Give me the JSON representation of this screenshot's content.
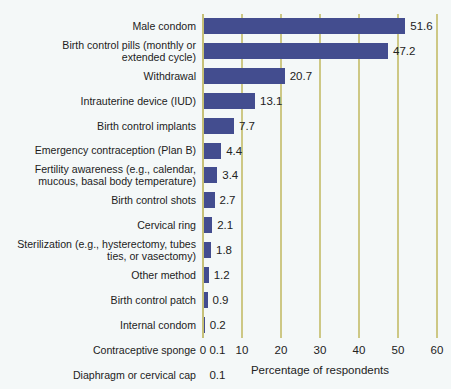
{
  "chart_data": {
    "type": "bar",
    "orientation": "horizontal",
    "title": "",
    "xlabel": "Percentage of respondents",
    "ylabel": "",
    "xlim": [
      0,
      60
    ],
    "xticks": [
      0,
      10,
      20,
      30,
      40,
      50,
      60
    ],
    "grid": true,
    "legend": null,
    "bar_color": "#434d8f",
    "grid_color": "#cdc885",
    "background_color": "#f4f8f8",
    "categories": [
      "Male condom",
      "Birth control pills (monthly or\nextended cycle)",
      "Withdrawal",
      "Intrauterine device (IUD)",
      "Birth control implants",
      "Emergency contraception (Plan B)",
      "Fertility awareness (e.g., calendar,\nmucous, basal body temperature)",
      "Birth control shots",
      "Cervical ring",
      "Sterilization (e.g., hysterectomy, tubes\nties, or vasectomy)",
      "Other method",
      "Birth control patch",
      "Internal condom",
      "Contraceptive sponge",
      "Diaphragm or cervical cap"
    ],
    "values": [
      51.6,
      47.2,
      20.7,
      13.1,
      7.7,
      4.4,
      3.4,
      2.7,
      2.1,
      1.8,
      1.2,
      0.9,
      0.2,
      0.1,
      0.1
    ],
    "value_labels": [
      "51.6",
      "47.2",
      "20.7",
      "13.1",
      "7.7",
      "4.4",
      "3.4",
      "2.7",
      "2.1",
      "1.8",
      "1.2",
      "0.9",
      "0.2",
      "0.1",
      "0.1"
    ],
    "tick_labels": [
      "0",
      "10",
      "20",
      "30",
      "40",
      "50",
      "60"
    ]
  }
}
